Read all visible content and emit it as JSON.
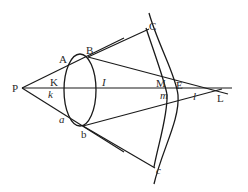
{
  "diagram": {
    "title": "",
    "labels": {
      "P": "P",
      "A": "A",
      "B": "B",
      "K": "K",
      "k": "k",
      "a": "a",
      "b": "b",
      "I": "I",
      "C": "C",
      "c": "c",
      "M": "M",
      "E": "E",
      "m": "m",
      "l": "l",
      "L": "L"
    },
    "colors": {
      "stroke": "#1a1a1a",
      "label": "#2a2a2a",
      "background": "#ffffff"
    }
  }
}
